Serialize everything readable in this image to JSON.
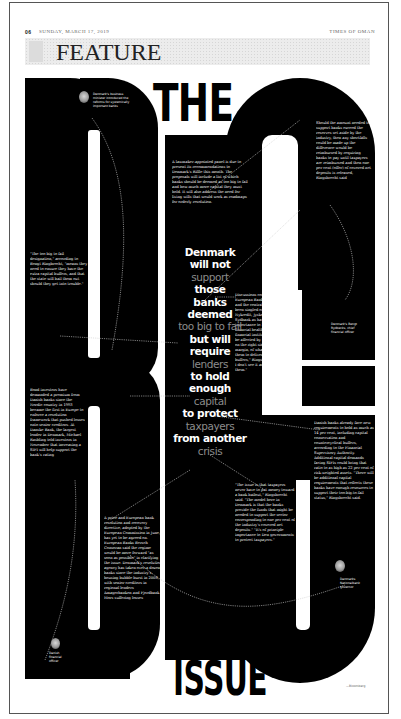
{
  "header": {
    "page_number": "06",
    "date": "SUNDAY, MARCH 17, 2019",
    "publication": "TIMES OF OMAN"
  },
  "section": {
    "title": "FEATURE"
  },
  "headline": {
    "top": "THE",
    "big_word": "BIG",
    "bottom": "ISSUE"
  },
  "pull_quote": {
    "lines": [
      {
        "text": "Denmark",
        "style": "bold"
      },
      {
        "text": "will not",
        "style": "bold"
      },
      {
        "text": "support",
        "style": "dim"
      },
      {
        "text": "those",
        "style": "bold"
      },
      {
        "text": "banks",
        "style": "bold"
      },
      {
        "text": "deemed",
        "style": "bold"
      },
      {
        "text": "too big to fail",
        "style": "dim"
      },
      {
        "text": "but will",
        "style": "bold"
      },
      {
        "text": "require",
        "style": "bold"
      },
      {
        "text": "lenders",
        "style": "dim"
      },
      {
        "text": "to hold enough",
        "style": "bold"
      },
      {
        "text": "capital",
        "style": "dim"
      },
      {
        "text": "to protect",
        "style": "bold"
      },
      {
        "text": "taxpayers",
        "style": "dim"
      },
      {
        "text": "from another",
        "style": "bold"
      },
      {
        "text": "crisis",
        "style": "dim"
      }
    ]
  },
  "callouts": {
    "top_left_caption": "Denmark's business minister introduced the reforms for systemically important banks",
    "top_center": "A lawmaker-appointed panel is due to present its recommendations to Denmark's Riffle this month. The proposals will include a list of which banks should be deemed as too big to fail and how much more capital they must hold. It will also address the need for living wills that would work as roadmaps for orderly resolution.",
    "top_right": "Should the amount needed to support banks exceed the reserves set aside by the industry, then any shortfalls could be made up the difference would be reimbursed by requiring banks to pay until taxpayers are reimbursed and then one per cent (offer) of covered net deposits is released, Ringsbrecht said",
    "left_quote": "\"The too big to fail designation,\" according to Bengt Ringbrecht, \"means they need to ensure they have the extra capital buffers, and that the state will bail them out should they get into trouble.\"",
    "right_mid_caption": "Denmark's Bengt Rydbecks, chief financial officer",
    "center_right": "Discussions conducted by the European Banking Authority and the central bank so have been singled out: Danske, Nykredit, Jyske Bank and Sydbank as having systemic importance to Denmark's financial health. \"All Danish financial institutions that might be affected by the bill come out on the right side, and by wide a margin, of what we expect them to deliver in extra capital buffers,\" Ringsbrecht said. \"So I don't see it as a challenge for them.\"",
    "left_mid": "Bond investors have demanded a premium from Danish banks since the Nordic country in 1993 became the first in Europe to enforce a resolution framework that pushed losses onto senior creditors. At Danske Bank, the largest lender in Denmark, Michael Rasbling told investors in November that increasing a SIFI will help support the bank's rating",
    "right_lower": "Danish banks already face new requirements to hold as much as 14 per cent, including capital conservation and countercyclical buffers, according to the Financial Supervisory Authority. Additional capital demands facing SIFIs could bring that ratio to as high as 22 per cent of risk-weighted assets. \"There will be additional capital requirements that reflects these banks have enough resources to support their too-big-to-fail status,\" Ringsbrecht said.",
    "center_lower": "\"The issue is that taxpayers never have to put money toward a bank bailout,\" Ringsbrecht said. \"The model here in Denmark is that the banks provide the funds that might be needed to support the sector corresponding to one per cent of the industry's covered net deposits.\" \"It's of principle importance to Den governments to protect taxpayers.\"",
    "lower_left": "A price and European bank resolution and recovery directive, adopted by the European Commission in June, has yet to be agreed on. European Banks Bersch Consoran said the regime would be more forward \"as soon as possible\" in clarifying the issue. Denmark's resolution agency has taken over a dozen banks since the industry's housing bubble burst in 2008, with senior creditors in regional lenders Amagerbanken and Fjordbank Mors suffering losses",
    "bottom_left_caption": "Danish financial officer",
    "bottom_right_caption": "Danmarks Nationalbank governor",
    "credit": "—Bloomberg"
  },
  "colors": {
    "ink": "#000000",
    "paper": "#ffffff",
    "dim_text": "#8c8c8c",
    "banner_bg": "#ececec",
    "frame": "#555555"
  }
}
